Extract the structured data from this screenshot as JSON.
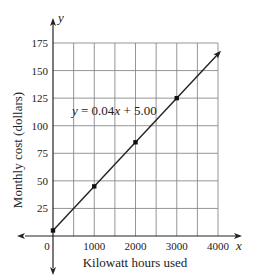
{
  "chart_data": {
    "type": "line",
    "title": "",
    "xlabel": "Kilowatt hours used",
    "ylabel": "Monthly cost (dollars)",
    "x_axis_var": "x",
    "y_axis_var": "y",
    "xlim": [
      0,
      4000
    ],
    "ylim": [
      0,
      175
    ],
    "x_ticks": [
      0,
      1000,
      2000,
      3000,
      4000
    ],
    "x_tick_labels": [
      "0",
      "1000",
      "2000",
      "3000",
      "4000"
    ],
    "y_ticks": [
      25,
      50,
      75,
      100,
      125,
      150,
      175
    ],
    "y_tick_labels": [
      "25",
      "50",
      "75",
      "100",
      "125",
      "150",
      "175"
    ],
    "grid": true,
    "grid_x_step": 500,
    "grid_y_step": 25,
    "equation": "y = 0.04x + 5.00",
    "series": [
      {
        "name": "y = 0.04x + 5.00",
        "slope": 0.04,
        "intercept": 5.0,
        "x": [
          0,
          1000,
          2000,
          3000
        ],
        "values": [
          5,
          45,
          85,
          125
        ],
        "marked_points": true,
        "arrow_end": true
      }
    ],
    "legend": null
  },
  "labels": {
    "equation_prefix": "y",
    "equation_mid": " = 0.04",
    "equation_x": "x",
    "equation_suffix": " + 5.00",
    "x_var": "x",
    "y_var": "y",
    "xlabel": "Kilowatt hours used",
    "ylabel": "Monthly cost (dollars)"
  }
}
